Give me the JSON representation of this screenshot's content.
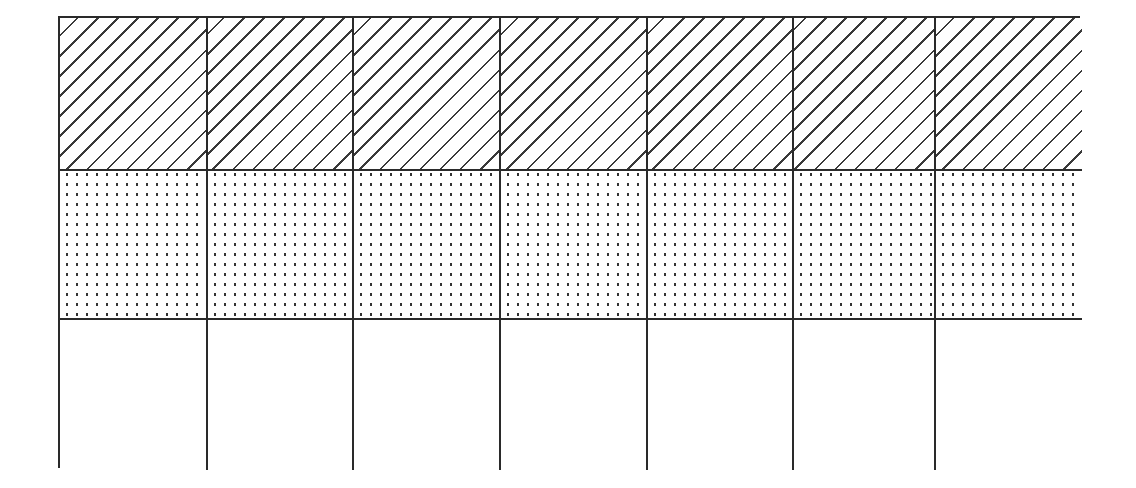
{
  "diagram": {
    "type": "fraction-grid",
    "columns": 7,
    "rows": 3,
    "border_color": "#2a2a2a",
    "rows_detail": [
      {
        "index": 0,
        "fill": "diagonal-hatch",
        "cells": 7
      },
      {
        "index": 1,
        "fill": "dotted",
        "cells": 7
      },
      {
        "index": 2,
        "fill": "blank",
        "cells": 7
      }
    ]
  }
}
